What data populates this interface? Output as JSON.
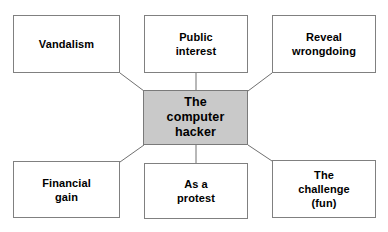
{
  "diagram": {
    "type": "mind-map",
    "title": "The computer hacker",
    "background_color": "#ffffff",
    "center": {
      "id": "center",
      "label": "The\ncomputer\nhacker",
      "fill_color": "#c9c9c9",
      "border_color": "#7a7a7a",
      "text_color": "#000000"
    },
    "nodes": [
      {
        "id": "vandalism",
        "label": "Vandalism",
        "position": "top-left",
        "fill_color": "#ffffff",
        "border_color": "#808080",
        "text_color": "#000000"
      },
      {
        "id": "public-interest",
        "label": "Public\ninterest",
        "position": "top-center",
        "fill_color": "#ffffff",
        "border_color": "#808080",
        "text_color": "#000000"
      },
      {
        "id": "reveal-wrongdoing",
        "label": "Reveal\nwrongdoing",
        "position": "top-right",
        "fill_color": "#ffffff",
        "border_color": "#808080",
        "text_color": "#000000"
      },
      {
        "id": "financial-gain",
        "label": "Financial\ngain",
        "position": "bottom-left",
        "fill_color": "#ffffff",
        "border_color": "#808080",
        "text_color": "#000000"
      },
      {
        "id": "as-a-protest",
        "label": "As a\nprotest",
        "position": "bottom-center",
        "fill_color": "#ffffff",
        "border_color": "#808080",
        "text_color": "#000000"
      },
      {
        "id": "the-challenge",
        "label": "The\nchallenge\n(fun)",
        "position": "bottom-right",
        "fill_color": "#ffffff",
        "border_color": "#808080",
        "text_color": "#000000"
      }
    ],
    "connectors": [
      {
        "from": "vandalism",
        "to": "center",
        "style": "diagonal"
      },
      {
        "from": "public-interest",
        "to": "center",
        "style": "vertical"
      },
      {
        "from": "reveal-wrongdoing",
        "to": "center",
        "style": "diagonal"
      },
      {
        "from": "financial-gain",
        "to": "center",
        "style": "diagonal"
      },
      {
        "from": "as-a-protest",
        "to": "center",
        "style": "vertical"
      },
      {
        "from": "the-challenge",
        "to": "center",
        "style": "diagonal"
      }
    ],
    "connector_color": "#707070"
  }
}
